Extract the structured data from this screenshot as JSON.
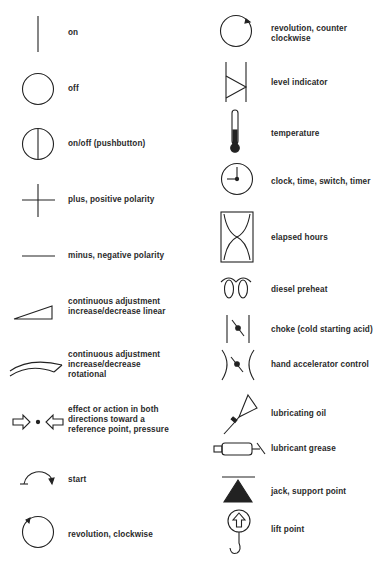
{
  "page": {
    "title": ""
  },
  "left_column": {
    "items": [
      {
        "icon": "on-icon",
        "label": "on"
      },
      {
        "icon": "off-icon",
        "label": "off"
      },
      {
        "icon": "on-off-pushbutton-icon",
        "label": "on/off (pushbutton)"
      },
      {
        "icon": "plus-icon",
        "label": "plus, positive polarity"
      },
      {
        "icon": "minus-icon",
        "label": "minus, negative polarity"
      },
      {
        "icon": "linear-adjustment-icon",
        "label_lines": [
          "continuous adjustment",
          "increase/decrease linear"
        ]
      },
      {
        "icon": "rotational-adjustment-icon",
        "label_lines": [
          "continuous adjustment",
          "increase/decrease",
          "rotational"
        ]
      },
      {
        "icon": "bidirectional-arrows-icon",
        "label_lines": [
          "effect or action in both",
          "directions toward a",
          "reference point, pressure"
        ]
      },
      {
        "icon": "start-icon",
        "label": "start"
      },
      {
        "icon": "revolution-clockwise-icon",
        "label": "revolution, clockwise"
      }
    ]
  },
  "right_column": {
    "items": [
      {
        "icon": "revolution-counter-clockwise-icon",
        "label_lines": [
          "revolution, counter",
          "clockwise"
        ]
      },
      {
        "icon": "level-indicator-icon",
        "label": "level indicator"
      },
      {
        "icon": "thermometer-icon",
        "label": "temperature"
      },
      {
        "icon": "clock-icon",
        "label": "clock, time, switch, timer"
      },
      {
        "icon": "hourglass-icon",
        "label": "elapsed hours"
      },
      {
        "icon": "diesel-preheat-icon",
        "label": "diesel preheat"
      },
      {
        "icon": "choke-icon",
        "label": "choke (cold starting acid)"
      },
      {
        "icon": "hand-accelerator-icon",
        "label": "hand accelerator control"
      },
      {
        "icon": "oil-can-icon",
        "label": "lubricating oil"
      },
      {
        "icon": "grease-gun-icon",
        "label": "lubricant grease"
      },
      {
        "icon": "jack-icon",
        "label": "jack, support point"
      },
      {
        "icon": "lift-hook-icon",
        "label": "lift point"
      }
    ]
  }
}
